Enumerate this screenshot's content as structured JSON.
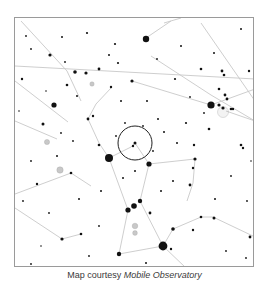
{
  "caption": {
    "prefix": "Map courtesy ",
    "source": "Mobile Observatory"
  },
  "map": {
    "frame": {
      "x": 14,
      "y": 17,
      "width": 240,
      "height": 250
    },
    "colors": {
      "background": "#ffffff",
      "border": "#9a9a9a",
      "star": "#111111",
      "line": "#c8c8c8",
      "nebula": "#9a9a9a",
      "highlight_circle": "#222222"
    },
    "highlight_circle": {
      "cx": 134,
      "cy": 142,
      "r": 17
    },
    "lines": [
      [
        14,
        65,
        254,
        78
      ],
      [
        20,
        20,
        66,
        70
      ],
      [
        66,
        70,
        80,
        100
      ],
      [
        14,
        80,
        67,
        121
      ],
      [
        14,
        120,
        56,
        138
      ],
      [
        150,
        55,
        210,
        94
      ],
      [
        210,
        94,
        254,
        120
      ],
      [
        163,
        22,
        180,
        17
      ],
      [
        145,
        37,
        170,
        20
      ],
      [
        200,
        22,
        254,
        100
      ],
      [
        131,
        80,
        210,
        104
      ],
      [
        210,
        104,
        254,
        88
      ],
      [
        87,
        118,
        95,
        103
      ],
      [
        95,
        103,
        110,
        87
      ],
      [
        87,
        118,
        98,
        142
      ],
      [
        98,
        142,
        108,
        157
      ],
      [
        108,
        157,
        130,
        146
      ],
      [
        130,
        146,
        134,
        142
      ],
      [
        134,
        142,
        148,
        163
      ],
      [
        148,
        163,
        194,
        158
      ],
      [
        194,
        158,
        192,
        182
      ],
      [
        192,
        182,
        186,
        200
      ],
      [
        108,
        157,
        127,
        209
      ],
      [
        127,
        209,
        118,
        253
      ],
      [
        148,
        163,
        139,
        200
      ],
      [
        139,
        200,
        162,
        245
      ],
      [
        118,
        253,
        162,
        245
      ],
      [
        162,
        245,
        172,
        228
      ],
      [
        172,
        228,
        200,
        216
      ],
      [
        200,
        216,
        212,
        216
      ],
      [
        212,
        216,
        254,
        236
      ],
      [
        162,
        245,
        185,
        267
      ],
      [
        14,
        193,
        70,
        172
      ],
      [
        70,
        172,
        90,
        185
      ],
      [
        14,
        207,
        61,
        238
      ],
      [
        61,
        238,
        80,
        233
      ],
      [
        225,
        110,
        254,
        120
      ]
    ],
    "stars": [
      {
        "x": 145,
        "y": 38,
        "r": 3.2
      },
      {
        "x": 49,
        "y": 54,
        "r": 1.6
      },
      {
        "x": 74,
        "y": 71,
        "r": 1.8
      },
      {
        "x": 85,
        "y": 72,
        "r": 1.6
      },
      {
        "x": 98,
        "y": 68,
        "r": 1.4
      },
      {
        "x": 66,
        "y": 84,
        "r": 1.3
      },
      {
        "x": 21,
        "y": 78,
        "r": 1.2
      },
      {
        "x": 131,
        "y": 80,
        "r": 1.6
      },
      {
        "x": 53,
        "y": 104,
        "r": 2.6
      },
      {
        "x": 42,
        "y": 123,
        "r": 1.5
      },
      {
        "x": 87,
        "y": 118,
        "r": 1.4
      },
      {
        "x": 92,
        "y": 115,
        "r": 1.2
      },
      {
        "x": 110,
        "y": 86,
        "r": 1.2
      },
      {
        "x": 98,
        "y": 144,
        "r": 1.3
      },
      {
        "x": 108,
        "y": 157,
        "r": 4.0
      },
      {
        "x": 134,
        "y": 142,
        "r": 1.5
      },
      {
        "x": 132,
        "y": 145,
        "r": 1.2
      },
      {
        "x": 148,
        "y": 163,
        "r": 2.6
      },
      {
        "x": 194,
        "y": 158,
        "r": 1.6
      },
      {
        "x": 193,
        "y": 144,
        "r": 1.2
      },
      {
        "x": 192,
        "y": 167,
        "r": 1.2
      },
      {
        "x": 189,
        "y": 184,
        "r": 1.4
      },
      {
        "x": 127,
        "y": 209,
        "r": 2.6
      },
      {
        "x": 133,
        "y": 205,
        "r": 2.8
      },
      {
        "x": 139,
        "y": 200,
        "r": 2.2
      },
      {
        "x": 149,
        "y": 212,
        "r": 1.4
      },
      {
        "x": 118,
        "y": 253,
        "r": 2.2
      },
      {
        "x": 162,
        "y": 245,
        "r": 4.4
      },
      {
        "x": 172,
        "y": 228,
        "r": 1.8
      },
      {
        "x": 170,
        "y": 248,
        "r": 1.2
      },
      {
        "x": 200,
        "y": 216,
        "r": 1.3
      },
      {
        "x": 213,
        "y": 217,
        "r": 1.5
      },
      {
        "x": 192,
        "y": 229,
        "r": 1.2
      },
      {
        "x": 249,
        "y": 236,
        "r": 1.4
      },
      {
        "x": 61,
        "y": 238,
        "r": 1.6
      },
      {
        "x": 80,
        "y": 233,
        "r": 1.3
      },
      {
        "x": 70,
        "y": 172,
        "r": 1.3
      },
      {
        "x": 36,
        "y": 183,
        "r": 1.2
      },
      {
        "x": 210,
        "y": 104,
        "r": 3.6
      },
      {
        "x": 218,
        "y": 104,
        "r": 1.6
      },
      {
        "x": 222,
        "y": 107,
        "r": 1.6
      },
      {
        "x": 226,
        "y": 98,
        "r": 1.4
      },
      {
        "x": 224,
        "y": 94,
        "r": 1.4
      },
      {
        "x": 230,
        "y": 108,
        "r": 1.3
      },
      {
        "x": 232,
        "y": 108,
        "r": 1.2
      },
      {
        "x": 218,
        "y": 88,
        "r": 1.3
      },
      {
        "x": 221,
        "y": 70,
        "r": 1.4
      },
      {
        "x": 223,
        "y": 74,
        "r": 1.3
      },
      {
        "x": 200,
        "y": 68,
        "r": 1.3
      },
      {
        "x": 248,
        "y": 70,
        "r": 1.2
      },
      {
        "x": 240,
        "y": 144,
        "r": 1.3
      },
      {
        "x": 242,
        "y": 147,
        "r": 1.2
      },
      {
        "x": 208,
        "y": 128,
        "r": 1.3
      },
      {
        "x": 185,
        "y": 122,
        "r": 1.1
      },
      {
        "x": 86,
        "y": 32,
        "r": 1.1
      },
      {
        "x": 114,
        "y": 43,
        "r": 1.1
      },
      {
        "x": 61,
        "y": 36,
        "r": 1.0
      },
      {
        "x": 108,
        "y": 54,
        "r": 1.0
      },
      {
        "x": 117,
        "y": 62,
        "r": 1.1
      },
      {
        "x": 174,
        "y": 78,
        "r": 1.1
      },
      {
        "x": 240,
        "y": 28,
        "r": 1.0
      },
      {
        "x": 213,
        "y": 52,
        "r": 1.0
      },
      {
        "x": 180,
        "y": 45,
        "r": 1.0
      },
      {
        "x": 25,
        "y": 35,
        "r": 0.9
      },
      {
        "x": 30,
        "y": 48,
        "r": 0.9
      },
      {
        "x": 76,
        "y": 95,
        "r": 1.0
      },
      {
        "x": 120,
        "y": 100,
        "r": 1.0
      },
      {
        "x": 146,
        "y": 100,
        "r": 1.0
      },
      {
        "x": 157,
        "y": 118,
        "r": 1.0
      },
      {
        "x": 163,
        "y": 131,
        "r": 1.0
      },
      {
        "x": 176,
        "y": 142,
        "r": 1.0
      },
      {
        "x": 60,
        "y": 132,
        "r": 0.9
      },
      {
        "x": 72,
        "y": 140,
        "r": 0.9
      },
      {
        "x": 56,
        "y": 155,
        "r": 1.0
      },
      {
        "x": 30,
        "y": 160,
        "r": 0.9
      },
      {
        "x": 22,
        "y": 200,
        "r": 0.9
      },
      {
        "x": 48,
        "y": 212,
        "r": 0.9
      },
      {
        "x": 78,
        "y": 198,
        "r": 1.0
      },
      {
        "x": 100,
        "y": 190,
        "r": 1.0
      },
      {
        "x": 122,
        "y": 177,
        "r": 1.0
      },
      {
        "x": 134,
        "y": 170,
        "r": 1.0
      },
      {
        "x": 160,
        "y": 190,
        "r": 1.0
      },
      {
        "x": 172,
        "y": 180,
        "r": 1.0
      },
      {
        "x": 214,
        "y": 198,
        "r": 1.0
      },
      {
        "x": 230,
        "y": 175,
        "r": 0.9
      },
      {
        "x": 246,
        "y": 200,
        "r": 0.9
      },
      {
        "x": 225,
        "y": 250,
        "r": 0.9
      },
      {
        "x": 245,
        "y": 257,
        "r": 0.9
      },
      {
        "x": 98,
        "y": 225,
        "r": 0.9
      },
      {
        "x": 88,
        "y": 255,
        "r": 0.9
      },
      {
        "x": 145,
        "y": 262,
        "r": 1.0
      },
      {
        "x": 30,
        "y": 263,
        "r": 0.9
      },
      {
        "x": 40,
        "y": 245,
        "r": 0.8
      },
      {
        "x": 156,
        "y": 58,
        "r": 0.9
      },
      {
        "x": 124,
        "y": 122,
        "r": 0.9
      },
      {
        "x": 142,
        "y": 125,
        "r": 0.9
      },
      {
        "x": 115,
        "y": 135,
        "r": 0.9
      },
      {
        "x": 152,
        "y": 150,
        "r": 0.9
      },
      {
        "x": 203,
        "y": 112,
        "r": 0.9
      },
      {
        "x": 189,
        "y": 96,
        "r": 0.9
      },
      {
        "x": 64,
        "y": 61,
        "r": 0.9
      },
      {
        "x": 45,
        "y": 90,
        "r": 0.8
      },
      {
        "x": 18,
        "y": 110,
        "r": 0.8
      },
      {
        "x": 250,
        "y": 160,
        "r": 0.8
      }
    ],
    "nebulae": [
      {
        "x": 46,
        "y": 141,
        "r": 2.6
      },
      {
        "x": 59,
        "y": 169,
        "r": 3.2
      },
      {
        "x": 134,
        "y": 225,
        "r": 2.8
      },
      {
        "x": 134,
        "y": 232,
        "r": 2.4
      },
      {
        "x": 91,
        "y": 83,
        "r": 2.2
      },
      {
        "x": 222,
        "y": 111,
        "r": 5.5
      }
    ]
  }
}
